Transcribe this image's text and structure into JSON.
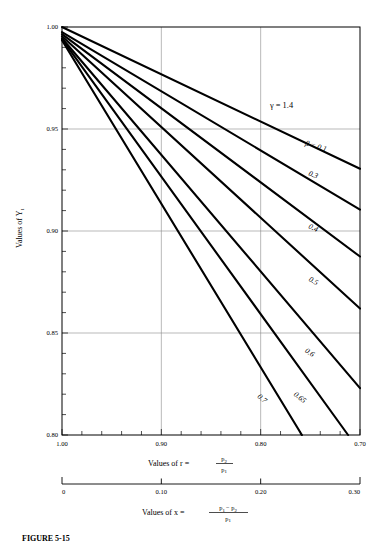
{
  "figure": {
    "caption": "FIGURE 5-15",
    "y_axis_title": "Values of Y",
    "y_axis_title_sub": "1",
    "primary_x_axis_title_prefix": "Values of r  =",
    "primary_x_axis_numerator": "p",
    "primary_x_axis_numerator_sub": "2",
    "primary_x_axis_denominator": "p",
    "primary_x_axis_denominator_sub": "1",
    "secondary_x_axis_title_prefix": "Values of x  =",
    "secondary_x_axis_numerator_a": "p",
    "secondary_x_axis_numerator_a_sub": "1",
    "secondary_x_axis_numerator_minus": "−",
    "secondary_x_axis_numerator_b": "p",
    "secondary_x_axis_numerator_b_sub": "2",
    "secondary_x_axis_denominator": "p",
    "secondary_x_axis_denominator_sub": "1",
    "gamma_annotation": "γ = 1.4",
    "beta_first_label": "β = 0.1"
  },
  "chart_data": {
    "type": "line",
    "title": "",
    "xlabel": "Values of r = p2/p1",
    "ylabel": "Values of Y1",
    "xlim": [
      1.0,
      0.7
    ],
    "ylim": [
      0.8,
      1.0
    ],
    "grid": true,
    "legend_position": "inline-curve-labels",
    "x_ticks_major": [
      "1.00",
      "0.90",
      "0.80",
      "0.70"
    ],
    "x_ticks_major_values": [
      1.0,
      0.9,
      0.8,
      0.7
    ],
    "x_minor_tick_step": 0.02,
    "y_ticks_major": [
      "1.00",
      "0.95",
      "0.90",
      "0.85",
      "0.80"
    ],
    "y_ticks_major_values": [
      1.0,
      0.95,
      0.9,
      0.85,
      0.8
    ],
    "y_minor_tick_step": 0.01,
    "gridlines_x_values": [
      0.9,
      0.8
    ],
    "gridlines_y_values": [
      0.95,
      0.9,
      0.85
    ],
    "secondary_x_ticks": [
      "0",
      "0.10",
      "0.20",
      "0.30"
    ],
    "secondary_x_ticks_values": [
      0,
      0.1,
      0.2,
      0.3
    ],
    "gamma": 1.4,
    "series": [
      {
        "name": "0.1",
        "beta": 0.1,
        "label": "β = 0.1",
        "label_x": 0.745,
        "label_y": 0.9405,
        "label_rotation": 17,
        "x": [
          1.0,
          0.7
        ],
        "y": [
          1.0,
          0.9305
        ]
      },
      {
        "name": "0.3",
        "beta": 0.3,
        "label": "0.3",
        "label_x": 0.748,
        "label_y": 0.9265,
        "label_rotation": 22,
        "x": [
          1.0,
          0.7
        ],
        "y": [
          0.9975,
          0.9105
        ]
      },
      {
        "name": "0.4",
        "beta": 0.4,
        "label": "0.4",
        "label_x": 0.748,
        "label_y": 0.9005,
        "label_rotation": 25,
        "x": [
          1.0,
          0.7
        ],
        "y": [
          0.9965,
          0.8875
        ]
      },
      {
        "name": "0.5",
        "beta": 0.5,
        "label": "0.5",
        "label_x": 0.748,
        "label_y": 0.8745,
        "label_rotation": 29,
        "x": [
          1.0,
          0.7
        ],
        "y": [
          0.9955,
          0.862
        ]
      },
      {
        "name": "0.6",
        "beta": 0.6,
        "label": "0.6",
        "label_x": 0.752,
        "label_y": 0.8395,
        "label_rotation": 34,
        "x": [
          1.0,
          0.7
        ],
        "y": [
          0.9945,
          0.823
        ]
      },
      {
        "name": "0.65",
        "beta": 0.65,
        "label": "0.65",
        "label_x": 0.762,
        "label_y": 0.8175,
        "label_rotation": 38,
        "x": [
          1.0,
          0.712
        ],
        "y": [
          0.994,
          0.8
        ]
      },
      {
        "name": "0.7",
        "beta": 0.7,
        "label": "0.7",
        "label_x": 0.8,
        "label_y": 0.817,
        "label_rotation": 40,
        "x": [
          1.0,
          0.7585
        ],
        "y": [
          0.9935,
          0.8
        ]
      }
    ]
  }
}
